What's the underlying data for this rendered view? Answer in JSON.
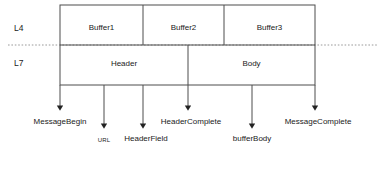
{
  "diagram": {
    "stroke_color": "#4d4d4d",
    "text_color": "#1a1a1a",
    "dotted_line_color": "#999999",
    "layers": [
      {
        "id": "l4",
        "label": "L4",
        "x": 14,
        "y": 24
      },
      {
        "id": "l7",
        "label": "L7",
        "x": 14,
        "y": 59
      }
    ],
    "l4_segments": [
      {
        "id": "buffer1",
        "label": "Buffer1",
        "x1": 60,
        "x2": 143,
        "center": 101.5
      },
      {
        "id": "buffer2",
        "label": "Buffer2",
        "x1": 143,
        "x2": 224,
        "center": 183.5
      },
      {
        "id": "buffer3",
        "label": "Buffer3",
        "x1": 224,
        "x2": 315,
        "center": 269.5
      }
    ],
    "l7_segments": [
      {
        "id": "header",
        "label": "Header",
        "x1": 60,
        "x2": 188,
        "center": 124
      },
      {
        "id": "body",
        "label": "Body",
        "x1": 188,
        "x2": 315,
        "center": 251.5
      }
    ],
    "events": [
      {
        "id": "message-begin",
        "label": "MessageBegin",
        "x": 60,
        "arrow_end_y": 110,
        "label_y": 118,
        "size": "normal",
        "label_anchor": "center"
      },
      {
        "id": "url",
        "label": "URL",
        "x": 104,
        "arrow_end_y": 128,
        "label_y": 136,
        "size": "small",
        "label_anchor": "center"
      },
      {
        "id": "header-field",
        "label": "HeaderField",
        "x": 143,
        "arrow_end_y": 128,
        "label_y": 135,
        "size": "normal",
        "label_anchor": "center"
      },
      {
        "id": "header-complete",
        "label": "HeaderComplete",
        "x": 188,
        "arrow_end_y": 110,
        "label_y": 118,
        "size": "normal",
        "label_anchor": "center"
      },
      {
        "id": "buffer-body",
        "label": "bufferBody",
        "x": 252,
        "arrow_end_y": 128,
        "label_y": 135,
        "size": "normal",
        "label_anchor": "center"
      },
      {
        "id": "message-complete",
        "label": "MessageComplete",
        "x": 315,
        "arrow_end_y": 110,
        "label_y": 118,
        "size": "normal",
        "label_anchor": "center"
      }
    ],
    "geometry": {
      "box_left": 60,
      "box_right": 315,
      "row_top": 5,
      "row_mid": 45,
      "row_bottom": 85,
      "dotted_y": 45,
      "dotted_x1": 8,
      "dotted_x2": 378
    }
  }
}
